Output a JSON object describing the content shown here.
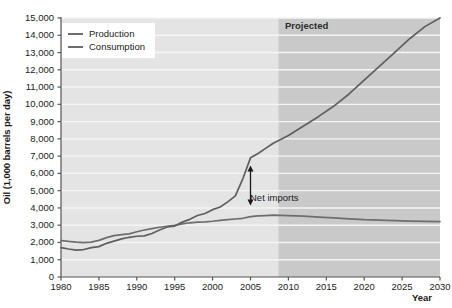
{
  "chart_data": {
    "type": "line",
    "title": "",
    "xlabel": "Year",
    "ylabel": "Oil (1,000 barrels per day)",
    "xlim": [
      1980,
      2030
    ],
    "ylim": [
      0,
      15000
    ],
    "xticks": [
      1980,
      1985,
      1990,
      1995,
      2000,
      2005,
      2010,
      2015,
      2020,
      2025,
      2030
    ],
    "xtick_labels": [
      "1980",
      "1985",
      "1990",
      "1995",
      "2000",
      "2005",
      "2010",
      "2015",
      "2020",
      "2025",
      "2030"
    ],
    "yticks": [
      0,
      1000,
      2000,
      3000,
      4000,
      5000,
      6000,
      7000,
      8000,
      9000,
      10000,
      11000,
      12000,
      13000,
      14000,
      15000
    ],
    "ytick_labels": [
      "0",
      "1,000",
      "2,000",
      "3,000",
      "4,000",
      "5,000",
      "6,000",
      "7,000",
      "8,000",
      "9,000",
      "10,000",
      "11,000",
      "12,000",
      "13,000",
      "14,000",
      "15,000"
    ],
    "grid": true,
    "legend_position": "top-left",
    "series": [
      {
        "name": "Production",
        "color": "#6d6d6d",
        "x": [
          1980,
          1981,
          1982,
          1983,
          1984,
          1985,
          1986,
          1987,
          1988,
          1989,
          1990,
          1991,
          1992,
          1993,
          1994,
          1995,
          1996,
          1997,
          1998,
          1999,
          2000,
          2001,
          2002,
          2003,
          2004,
          2005,
          2006,
          2007,
          2008,
          2009,
          2010,
          2012,
          2014,
          2016,
          2018,
          2020,
          2022,
          2024,
          2026,
          2028,
          2030
        ],
        "values": [
          2110,
          2060,
          2020,
          1990,
          2020,
          2120,
          2280,
          2400,
          2450,
          2500,
          2620,
          2720,
          2800,
          2880,
          2940,
          2990,
          3080,
          3140,
          3180,
          3190,
          3230,
          3280,
          3320,
          3360,
          3400,
          3500,
          3540,
          3560,
          3580,
          3570,
          3560,
          3520,
          3470,
          3420,
          3370,
          3320,
          3290,
          3260,
          3240,
          3220,
          3210
        ]
      },
      {
        "name": "Consumption",
        "color": "#5f5f5f",
        "x": [
          1980,
          1981,
          1982,
          1983,
          1984,
          1985,
          1986,
          1987,
          1988,
          1989,
          1990,
          1991,
          1992,
          1993,
          1994,
          1995,
          1996,
          1997,
          1998,
          1999,
          2000,
          2001,
          2002,
          2003,
          2004,
          2005,
          2006,
          2007,
          2008,
          2010,
          2012,
          2014,
          2016,
          2018,
          2020,
          2022,
          2024,
          2026,
          2028,
          2030
        ],
        "values": [
          1700,
          1620,
          1560,
          1590,
          1700,
          1760,
          1950,
          2080,
          2210,
          2300,
          2360,
          2380,
          2520,
          2720,
          2900,
          2950,
          3180,
          3340,
          3560,
          3680,
          3900,
          4050,
          4350,
          4700,
          5700,
          6900,
          7150,
          7450,
          7750,
          8200,
          8750,
          9300,
          9900,
          10600,
          11400,
          12200,
          13000,
          13800,
          14500,
          15000
        ]
      }
    ],
    "annotations": [
      {
        "name": "projected-region",
        "label": "Projected",
        "type": "shaded-band",
        "x_start": 2008.7,
        "x_end": 2030,
        "color": "#c9c9c9"
      },
      {
        "name": "net-imports-arrow",
        "label": "Net imports",
        "type": "double-arrow",
        "x": 2005,
        "y_top": 6200,
        "y_bottom": 4400
      }
    ]
  },
  "plot": {
    "background": "#e4e4e4",
    "projected_background": "#c9c9c9",
    "gridline_color": "#f5f5f5",
    "axis_color": "#555555"
  }
}
